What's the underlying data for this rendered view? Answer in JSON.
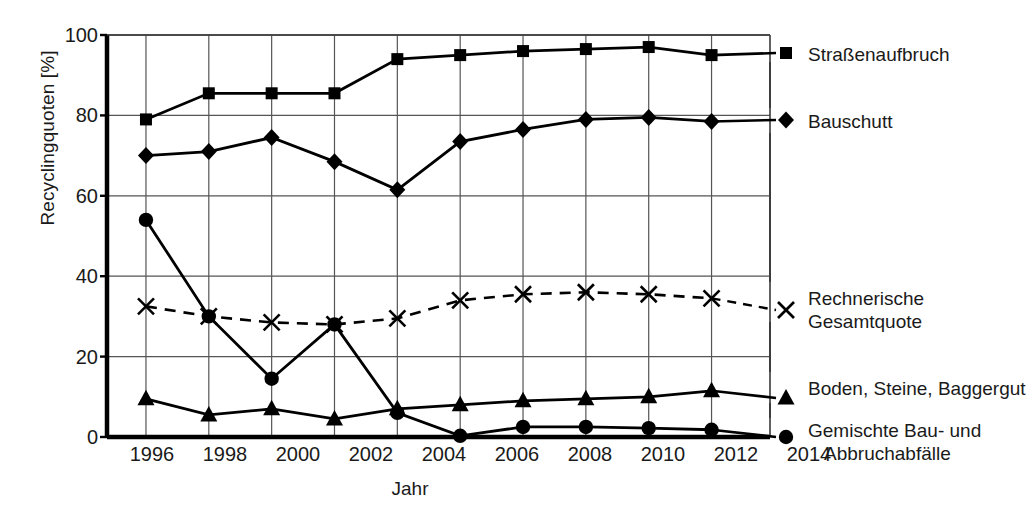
{
  "chart_data": {
    "type": "line",
    "title": "",
    "xlabel": "Jahr",
    "ylabel": "Recyclingquoten [%]",
    "xlim": [
      1995,
      2015
    ],
    "ylim": [
      0,
      100
    ],
    "yticks": [
      0,
      20,
      40,
      60,
      80,
      100
    ],
    "grid": true,
    "legend_position": "right-inline",
    "categories": [
      1996,
      1998,
      2000,
      2002,
      2004,
      2006,
      2008,
      2010,
      2012,
      2014
    ],
    "x_tick_labels": [
      "1996",
      "1998",
      "2000",
      "2002",
      "2004",
      "2006",
      "2008",
      "2010",
      "2012",
      "2014"
    ],
    "y_tick_labels": [
      "0",
      "20",
      "40",
      "60",
      "80",
      "100"
    ],
    "series": [
      {
        "name": "Straßenaufbruch",
        "marker": "square",
        "line": "solid",
        "color": "#000000",
        "values": [
          79,
          85.5,
          85.5,
          85.5,
          94,
          95,
          96,
          96.5,
          97,
          95
        ]
      },
      {
        "name": "Bauschutt",
        "marker": "diamond",
        "line": "solid",
        "color": "#000000",
        "values": [
          70,
          71,
          74.5,
          68.5,
          61.5,
          73.5,
          76.5,
          79,
          79.5,
          78.5
        ]
      },
      {
        "name": "Rechnerische\nGesamtquote",
        "marker": "x",
        "line": "dashed",
        "color": "#000000",
        "values": [
          32.5,
          30,
          28.5,
          28,
          29.5,
          34,
          35.5,
          36,
          35.5,
          34.5
        ]
      },
      {
        "name": "Boden, Steine, Baggergut",
        "marker": "triangle",
        "line": "solid",
        "color": "#000000",
        "values": [
          9.5,
          5.5,
          7,
          4.5,
          7,
          8,
          9,
          9.5,
          10,
          11.5
        ]
      },
      {
        "name": "Gemischte Bau- und\nAbbruchabfälle",
        "marker": "circle",
        "line": "solid",
        "color": "#000000",
        "values": [
          54,
          30,
          14.5,
          28,
          6,
          0.3,
          2.5,
          2.5,
          2.2,
          1.8
        ]
      }
    ]
  },
  "axes": {
    "y_title": "Recyclingquoten [%]",
    "x_title": "Jahr"
  },
  "legend": {
    "strassenaufbruch": "Straßenaufbruch",
    "bauschutt": "Bauschutt",
    "gesamtquote_line1": "Rechnerische",
    "gesamtquote_line2": "Gesamtquote",
    "boden": "Boden, Steine, Baggergut",
    "gemischte_line1": "Gemischte Bau- und",
    "gemischte_line2": "Abbruchabfälle"
  },
  "yticks": {
    "t0": "0",
    "t20": "20",
    "t40": "40",
    "t60": "60",
    "t80": "80",
    "t100": "100"
  },
  "xticks": {
    "t1996": "1996",
    "t1998": "1998",
    "t2000": "2000",
    "t2002": "2002",
    "t2004": "2004",
    "t2006": "2006",
    "t2008": "2008",
    "t2010": "2010",
    "t2012": "2012",
    "t2014": "2014"
  },
  "colors": {
    "ink": "#000000",
    "grid": "#555555",
    "background": "#ffffff"
  }
}
